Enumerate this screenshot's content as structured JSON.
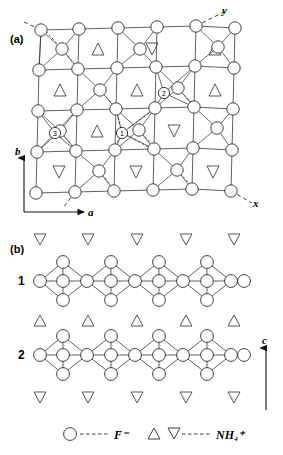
{
  "figure": {
    "panels": [
      {
        "id": "a",
        "label": "(a)",
        "axes": [
          {
            "name": "b",
            "label": "b",
            "direction": "up"
          },
          {
            "name": "a",
            "label": "a",
            "direction": "right"
          },
          {
            "name": "x",
            "label": "x",
            "direction": "diagonal-down-right"
          },
          {
            "name": "y",
            "label": "y",
            "direction": "diagonal-up-right"
          }
        ],
        "site_markers": [
          {
            "label": "1",
            "x": 122,
            "y": 133
          },
          {
            "label": "2",
            "x": 164,
            "y": 93
          },
          {
            "label": "3",
            "x": 55,
            "y": 133
          }
        ]
      },
      {
        "id": "b",
        "label": "(b)",
        "row_labels": [
          "1",
          "2"
        ],
        "axes": [
          {
            "name": "c",
            "label": "c",
            "direction": "up"
          }
        ]
      }
    ],
    "legend": {
      "items": [
        {
          "symbol": "circle",
          "dashes": "----",
          "species": "F",
          "charge": "−",
          "text": "F⁻"
        },
        {
          "symbol": "triangle-up triangle-down",
          "dashes": "----",
          "species": "NH",
          "subscript": "4",
          "charge": "+",
          "text": "NH₄⁺"
        }
      ]
    }
  }
}
